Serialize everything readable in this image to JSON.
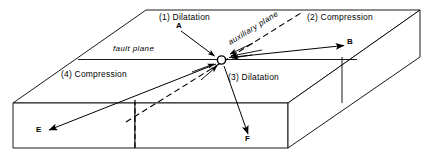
{
  "figure": {
    "background_color": "#ffffff",
    "line_color": "#000000",
    "width": 433,
    "height": 158
  },
  "labels": {
    "quadrant_1": "(1) Dilatation",
    "quadrant_2": "(2) Compression",
    "quadrant_3": "(3) Dilatation",
    "quadrant_4": "(4) Compression",
    "fault_plane": "fault plane",
    "auxiliary_plane": "auxiliary plane",
    "axis_a": "A",
    "axis_b": "B",
    "axis_e": "E",
    "axis_f": "F"
  },
  "diagram_data": {
    "type": "block-diagram",
    "focus_point": {
      "x": 221,
      "y": 60
    },
    "block_top_face": [
      {
        "x": 13,
        "y": 103
      },
      {
        "x": 146,
        "y": 10
      },
      {
        "x": 420,
        "y": 10
      },
      {
        "x": 288,
        "y": 103
      }
    ],
    "block_front_face": [
      {
        "x": 13,
        "y": 103
      },
      {
        "x": 288,
        "y": 103
      },
      {
        "x": 288,
        "y": 148
      },
      {
        "x": 13,
        "y": 148
      }
    ],
    "block_right_face": [
      {
        "x": 288,
        "y": 103
      },
      {
        "x": 420,
        "y": 10
      },
      {
        "x": 420,
        "y": 57
      },
      {
        "x": 288,
        "y": 148
      }
    ],
    "fault_plane_line": [
      {
        "x": 78,
        "y": 60
      },
      {
        "x": 355,
        "y": 60
      }
    ],
    "auxiliary_plane_line": [
      {
        "x": 125,
        "y": 122
      },
      {
        "x": 300,
        "y": 14
      }
    ],
    "vertical_fault_trace": [
      {
        "x": 135,
        "y": 100
      },
      {
        "x": 135,
        "y": 148
      }
    ],
    "arrows": [
      {
        "name": "A",
        "from": {
          "x": 182,
          "y": 32
        },
        "to": {
          "x": 216,
          "y": 57
        },
        "arrowhead": "to"
      },
      {
        "name": "B",
        "from": {
          "x": 228,
          "y": 58
        },
        "to": {
          "x": 345,
          "y": 46
        },
        "arrowhead": "to"
      },
      {
        "name": "E",
        "from": {
          "x": 216,
          "y": 64
        },
        "to": {
          "x": 48,
          "y": 130
        },
        "arrowhead": "to"
      },
      {
        "name": "F",
        "from": {
          "x": 224,
          "y": 66
        },
        "to": {
          "x": 248,
          "y": 135
        },
        "arrowhead": "to"
      }
    ],
    "focal_arrows_inward": [
      {
        "from": {
          "x": 258,
          "y": 52
        },
        "to": {
          "x": 230,
          "y": 57
        }
      },
      {
        "from": {
          "x": 264,
          "y": 46
        },
        "to": {
          "x": 232,
          "y": 56
        }
      },
      {
        "from": {
          "x": 196,
          "y": 72
        },
        "to": {
          "x": 216,
          "y": 64
        }
      },
      {
        "from": {
          "x": 205,
          "y": 78
        },
        "to": {
          "x": 218,
          "y": 66
        }
      },
      {
        "from": {
          "x": 272,
          "y": 49
        },
        "to": {
          "x": 235,
          "y": 55
        }
      }
    ],
    "focus_marker": {
      "shape": "small-circle",
      "radius": 4
    }
  }
}
